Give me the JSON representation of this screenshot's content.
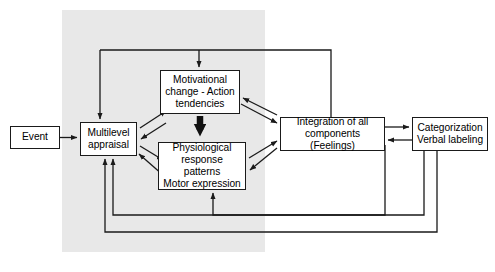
{
  "diagram": {
    "background_color": "#ffffff",
    "panel_color": "#e8e8e8",
    "line_color": "#1a1a1a",
    "box_border_color": "#1a1a1a",
    "box_fill_color": "#ffffff",
    "shaded_panel": {
      "name": "organismic-subsystems-panel",
      "x": 62,
      "y": 10,
      "width": 203,
      "height": 242
    },
    "nodes": [
      {
        "id": "event",
        "label": "Event",
        "lines": [
          "Event"
        ],
        "x": 10,
        "y": 126,
        "width": 50,
        "height": 23
      },
      {
        "id": "multilevel-appraisal",
        "label": "Multilevel appraisal",
        "lines": [
          "Multilevel",
          "appraisal"
        ],
        "x": 80,
        "y": 122,
        "width": 57,
        "height": 34
      },
      {
        "id": "motivational-change",
        "label": "Motivational change - Action tendencies",
        "lines": [
          "Motivational",
          "change - Action",
          "tendencies"
        ],
        "x": 160,
        "y": 70,
        "width": 80,
        "height": 44
      },
      {
        "id": "physiological-response",
        "label": "Physiological response patterns Motor expression",
        "lines": [
          "Physiological",
          "response patterns",
          "Motor expression"
        ],
        "x": 158,
        "y": 142,
        "width": 88,
        "height": 48
      },
      {
        "id": "integration-feelings",
        "label": "Integration of all components (Feelings)",
        "lines": [
          "Integration of all",
          "components (Feelings)"
        ],
        "x": 280,
        "y": 117,
        "width": 105,
        "height": 34
      },
      {
        "id": "categorization-labeling",
        "label": "Categorization Verbal labeling",
        "lines": [
          "Categorization",
          "Verbal labeling"
        ],
        "x": 412,
        "y": 117,
        "width": 76,
        "height": 34
      }
    ],
    "edges": [
      {
        "id": "event-to-appraisal",
        "from": "event",
        "to": "multilevel-appraisal",
        "style": "straight-arrow"
      },
      {
        "id": "appraisal-to-motivational",
        "from": "multilevel-appraisal",
        "to": "motivational-change",
        "style": "diagonal-arrow"
      },
      {
        "id": "motivational-to-appraisal",
        "from": "motivational-change",
        "to": "multilevel-appraisal",
        "style": "diagonal-arrow"
      },
      {
        "id": "appraisal-to-physiological",
        "from": "multilevel-appraisal",
        "to": "physiological-response",
        "style": "diagonal-arrow"
      },
      {
        "id": "physiological-to-appraisal",
        "from": "physiological-response",
        "to": "multilevel-appraisal",
        "style": "diagonal-arrow"
      },
      {
        "id": "motivational-to-physiological",
        "from": "motivational-change",
        "to": "physiological-response",
        "style": "bold-arrow"
      },
      {
        "id": "motivational-to-integration",
        "from": "motivational-change",
        "to": "integration-feelings",
        "style": "diagonal-arrow"
      },
      {
        "id": "integration-to-motivational",
        "from": "integration-feelings",
        "to": "motivational-change",
        "style": "diagonal-arrow"
      },
      {
        "id": "physiological-to-integration",
        "from": "physiological-response",
        "to": "integration-feelings",
        "style": "diagonal-arrow"
      },
      {
        "id": "integration-to-physiological",
        "from": "integration-feelings",
        "to": "physiological-response",
        "style": "diagonal-arrow"
      },
      {
        "id": "integration-to-categorization",
        "from": "integration-feelings",
        "to": "categorization-labeling",
        "style": "straight-arrow"
      },
      {
        "id": "categorization-to-integration",
        "from": "categorization-labeling",
        "to": "integration-feelings",
        "style": "straight-arrow"
      },
      {
        "id": "integration-feedback-top-appraisal",
        "from": "integration-feelings",
        "to": "multilevel-appraisal",
        "style": "orthogonal-feedback-top"
      },
      {
        "id": "integration-feedback-top-motivational",
        "from": "integration-feelings",
        "to": "motivational-change",
        "style": "orthogonal-feedback-top"
      },
      {
        "id": "categorization-feedback-physiological",
        "from": "categorization-labeling",
        "to": "physiological-response",
        "style": "orthogonal-feedback-bottom"
      },
      {
        "id": "categorization-feedback-appraisal",
        "from": "categorization-labeling",
        "to": "multilevel-appraisal",
        "style": "orthogonal-feedback-bottom"
      },
      {
        "id": "integration-feedback-bottom",
        "from": "integration-feelings",
        "to": "multilevel-appraisal",
        "style": "orthogonal-feedback-bottom"
      }
    ]
  }
}
